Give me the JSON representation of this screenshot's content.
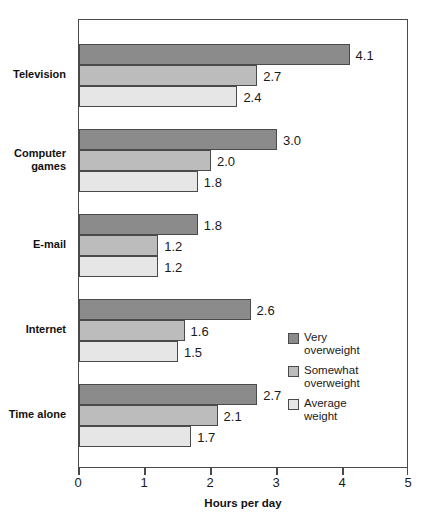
{
  "chart_data": {
    "type": "bar",
    "orientation": "horizontal",
    "title": "",
    "title_clipped": true,
    "categories": [
      "Television",
      "Computer\ngames",
      "E-mail",
      "Internet",
      "Time alone"
    ],
    "series": [
      {
        "name": "Very overweight",
        "label": "Very\noverweight",
        "color": "#8b8b8b",
        "values": [
          4.1,
          3.0,
          1.8,
          2.6,
          2.7
        ]
      },
      {
        "name": "Somewhat overweight",
        "label": "Somewhat\noverweight",
        "color": "#bcbcbc",
        "values": [
          2.7,
          2.0,
          1.2,
          1.6,
          2.1
        ]
      },
      {
        "name": "Average weight",
        "label": "Average\nweight",
        "color": "#e6e6e6",
        "values": [
          2.4,
          1.8,
          1.2,
          1.5,
          1.7
        ]
      }
    ],
    "value_labels": [
      [
        "4.1",
        "2.7",
        "2.4"
      ],
      [
        "3.0",
        "2.0",
        "1.8"
      ],
      [
        "1.8",
        "1.2",
        "1.2"
      ],
      [
        "2.6",
        "1.6",
        "1.5"
      ],
      [
        "2.7",
        "2.1",
        "1.7"
      ]
    ],
    "xlabel": "Hours per day",
    "ylabel": "",
    "xlim": [
      0,
      5
    ],
    "xticks": [
      0,
      1,
      2,
      3,
      4,
      5
    ],
    "xtick_labels": [
      "0",
      "1",
      "2",
      "3",
      "4",
      "5"
    ],
    "grid": false,
    "legend_position": "inside-right",
    "frame_color": "#4a4a4a",
    "background": "#ffffff"
  }
}
